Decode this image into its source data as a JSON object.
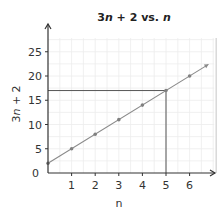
{
  "chart_data": {
    "type": "line",
    "title": "3n + 2 vs. n",
    "title_parts": [
      {
        "text": "3",
        "italic": false
      },
      {
        "text": "n",
        "italic": true
      },
      {
        "text": " + 2 vs. ",
        "italic": false
      },
      {
        "text": "n",
        "italic": true
      }
    ],
    "xlabel": "n",
    "ylabel": "3n + 2",
    "ylabel_parts": [
      {
        "text": "3",
        "italic": false
      },
      {
        "text": "n",
        "italic": true
      },
      {
        "text": " + 2",
        "italic": false
      }
    ],
    "x_ticks": [
      1,
      2,
      3,
      4,
      5,
      6
    ],
    "y_ticks": [
      0,
      5,
      10,
      15,
      20,
      25
    ],
    "xlim": [
      0,
      7
    ],
    "ylim": [
      0,
      27
    ],
    "grid": true,
    "series": [
      {
        "name": "3n + 2",
        "x": [
          0,
          1,
          2,
          3,
          4,
          5,
          6
        ],
        "values": [
          2,
          5,
          8,
          11,
          14,
          17,
          20
        ],
        "line_extends_to": {
          "x": 6.8,
          "y": 22.4
        },
        "color": "#8a8a8a"
      }
    ],
    "annotations": [
      {
        "type": "vertical_reference_line",
        "x": 5,
        "from_y": 0,
        "to_y": 17
      },
      {
        "type": "horizontal_reference_line",
        "y": 17,
        "from_x": 0,
        "to_x": 5
      }
    ],
    "legend": null
  },
  "colors": {
    "axis": "#333333",
    "grid": "#ececec",
    "line": "#8a8a8a",
    "point": "#808080",
    "reference": "#555555",
    "plot_border": "#d9d9d9"
  }
}
